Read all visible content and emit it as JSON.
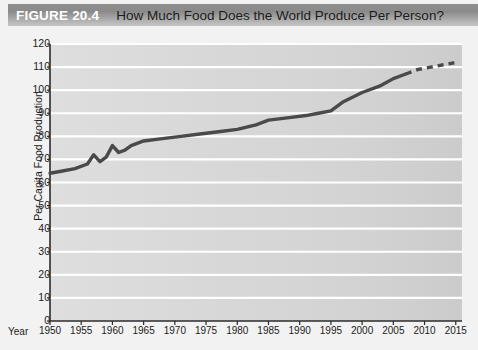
{
  "header": {
    "figure_number": "FIGURE 20.4",
    "title": "How Much Food Does the World Produce Per Person?",
    "bar_color": "#8f8f8f",
    "number_color": "#ffffff",
    "title_color": "#1c1c1c"
  },
  "chart_data": {
    "type": "line",
    "title": "How Much Food Does the World Produce Per Person?",
    "xlabel": "Year",
    "ylabel": "Per Capita Food Production",
    "xlim": [
      1950,
      2016
    ],
    "ylim": [
      0,
      120
    ],
    "grid": true,
    "legend": "none",
    "plot_bg_color": "#d6d6d6",
    "gridline_color": "#ffffff",
    "line_color": "#4a4a4a",
    "axis_color": "#2b2b2b",
    "y_ticks": [
      0,
      10,
      20,
      30,
      40,
      50,
      60,
      70,
      80,
      90,
      100,
      110,
      120
    ],
    "x_ticks": [
      1950,
      1955,
      1960,
      1965,
      1970,
      1975,
      1980,
      1985,
      1990,
      1995,
      2000,
      2005,
      2010,
      2015
    ],
    "series": [
      {
        "name": "Per Capita Food Production",
        "style": "solid",
        "x": [
          1950,
          1952,
          1954,
          1956,
          1957,
          1958,
          1959,
          1960,
          1961,
          1962,
          1963,
          1965,
          1968,
          1971,
          1974,
          1977,
          1980,
          1983,
          1985,
          1988,
          1991,
          1993,
          1995,
          1997,
          2000,
          2003,
          2005,
          2007
        ],
        "values": [
          64,
          65,
          66,
          68,
          72,
          69,
          71,
          76,
          73,
          74,
          76,
          78,
          79,
          80,
          81,
          82,
          83,
          85,
          87,
          88,
          89,
          90,
          91,
          95,
          99,
          102,
          105,
          107
        ]
      },
      {
        "name": "Projection",
        "style": "dashed",
        "x": [
          2007,
          2009,
          2011,
          2013,
          2015
        ],
        "values": [
          107,
          109,
          110,
          111,
          112
        ]
      }
    ]
  }
}
